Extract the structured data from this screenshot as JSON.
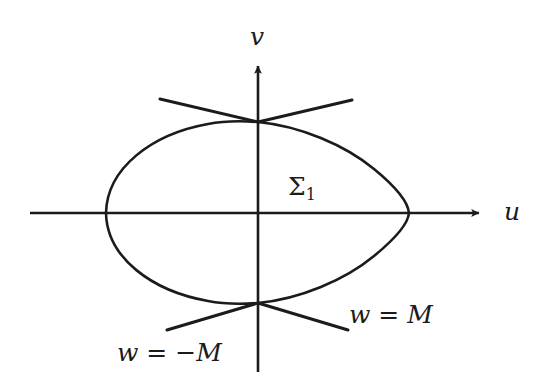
{
  "figure": {
    "type": "diagram",
    "title": "",
    "background_color": "#ffffff",
    "stroke_color": "#1b1b1b",
    "width": 551,
    "height": 381,
    "axes": {
      "horizontal": {
        "name": "u-axis",
        "label": "u",
        "label_position": {
          "x": 514,
          "y": 213
        },
        "start": {
          "x": 30,
          "y": 213
        },
        "end": {
          "x": 483,
          "y": 213
        },
        "arrow": "end"
      },
      "vertical": {
        "name": "v-axis",
        "label": "v",
        "label_position": {
          "x": 258,
          "y": 37
        },
        "start": {
          "x": 258,
          "y": 372
        },
        "end": {
          "x": 258,
          "y": 62
        },
        "arrow": "end"
      },
      "origin": {
        "x": 258,
        "y": 213
      }
    },
    "curves": [
      {
        "name": "lens-upper-arc",
        "description": "upper arc of the lens-shaped closed curve",
        "from": {
          "x": 106,
          "y": 213
        },
        "to": {
          "x": 409,
          "y": 213
        },
        "apex": {
          "x": 258,
          "y": 122
        }
      },
      {
        "name": "lens-lower-arc",
        "description": "lower arc of the lens-shaped closed curve",
        "from": {
          "x": 106,
          "y": 213
        },
        "to": {
          "x": 409,
          "y": 213
        },
        "apex": {
          "x": 258,
          "y": 303
        }
      }
    ],
    "lines": [
      {
        "name": "level-line-upper-left",
        "from": {
          "x": 160,
          "y": 99
        },
        "to": {
          "x": 258,
          "y": 122
        }
      },
      {
        "name": "level-line-upper-right",
        "from": {
          "x": 258,
          "y": 122
        },
        "to": {
          "x": 352,
          "y": 100
        }
      },
      {
        "name": "level-line-lower-left",
        "from": {
          "x": 167,
          "y": 330
        },
        "to": {
          "x": 258,
          "y": 303
        }
      },
      {
        "name": "level-line-lower-right",
        "from": {
          "x": 258,
          "y": 303
        },
        "to": {
          "x": 348,
          "y": 330
        }
      }
    ],
    "labels": {
      "axis_u": "u",
      "axis_v": "v",
      "region_sigma": "Σ",
      "region_sigma_subscript": "1",
      "level_positive": "w = M",
      "level_negative": "w = −M"
    }
  }
}
